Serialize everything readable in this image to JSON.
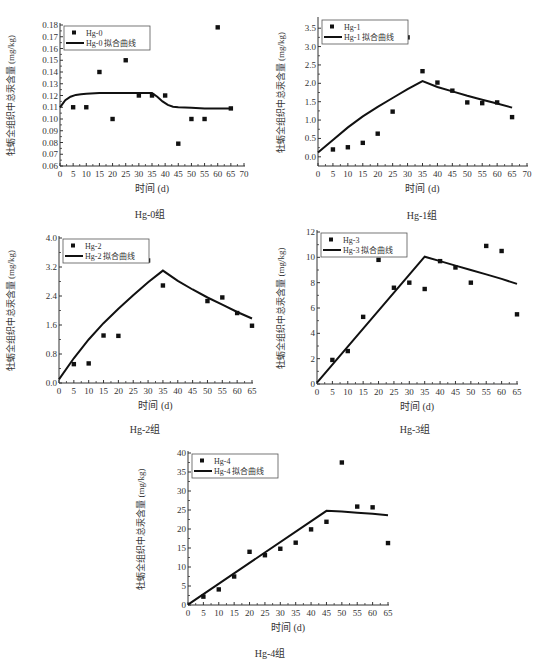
{
  "common": {
    "ylabel": "牡蛎全组织中总汞含量 (mg/kg)",
    "xlabel": "时间 (d)"
  },
  "chart_data": [
    {
      "id": "hg0",
      "type": "scatter",
      "caption": "Hg-0组",
      "title": "",
      "xlabel": "时间 (d)",
      "ylabel": "牡蛎全组织中总汞含量 (mg/kg)",
      "xlim": [
        0,
        70
      ],
      "ylim": [
        0.06,
        0.18
      ],
      "xticks": [
        0,
        5,
        10,
        15,
        20,
        25,
        30,
        35,
        40,
        45,
        50,
        55,
        60,
        65,
        70
      ],
      "yticks": [
        0.06,
        0.07,
        0.08,
        0.09,
        0.1,
        0.11,
        0.12,
        0.13,
        0.14,
        0.15,
        0.16,
        0.17,
        0.18
      ],
      "ytick_labels": [
        "0.06",
        "0.07",
        "0.08",
        "0.09",
        "0.10",
        "0.11",
        "0.12",
        "0.13",
        "0.14",
        "0.15",
        "0.16",
        "0.17",
        "0.18"
      ],
      "legend": [
        "Hg-0",
        "Hg-0 拟合曲线"
      ],
      "legend_position": "upper left",
      "series": [
        {
          "name": "Hg-0",
          "kind": "points",
          "x": [
            5,
            10,
            15,
            20,
            25,
            30,
            35,
            40,
            45,
            50,
            55,
            60,
            65
          ],
          "y": [
            0.11,
            0.11,
            0.14,
            0.1,
            0.15,
            0.12,
            0.12,
            0.12,
            0.079,
            0.1,
            0.1,
            0.178,
            0.109
          ]
        },
        {
          "name": "Hg-0 拟合曲线",
          "kind": "line",
          "x": [
            0,
            2,
            4,
            6,
            8,
            10,
            15,
            20,
            25,
            30,
            35,
            37,
            39,
            41,
            43,
            45,
            50,
            55,
            60,
            65
          ],
          "y": [
            0.11,
            0.116,
            0.119,
            0.1205,
            0.121,
            0.1215,
            0.122,
            0.122,
            0.122,
            0.122,
            0.122,
            0.119,
            0.115,
            0.112,
            0.1105,
            0.11,
            0.1095,
            0.109,
            0.109,
            0.109
          ]
        }
      ]
    },
    {
      "id": "hg1",
      "type": "scatter",
      "caption": "Hg-1组",
      "title": "",
      "xlabel": "时间 (d)",
      "ylabel": "牡蛎全组织中总汞含量 (mg/kg)",
      "xlim": [
        0,
        70
      ],
      "ylim": [
        -0.25,
        3.75
      ],
      "xticks": [
        0,
        5,
        10,
        15,
        20,
        25,
        30,
        35,
        40,
        45,
        50,
        55,
        60,
        65,
        70
      ],
      "yticks": [
        0.0,
        0.5,
        1.0,
        1.5,
        2.0,
        2.5,
        3.0,
        3.5
      ],
      "ytick_labels": [
        "0.0",
        "0.5",
        "1.0",
        "1.5",
        "2.0",
        "2.5",
        "3.0",
        "3.5"
      ],
      "legend": [
        "Hg-1",
        "Hg-1 拟合曲线"
      ],
      "legend_position": "upper left",
      "series": [
        {
          "name": "Hg-1",
          "kind": "points",
          "x": [
            5,
            10,
            15,
            20,
            25,
            30,
            35,
            40,
            45,
            50,
            55,
            60,
            65
          ],
          "y": [
            0.2,
            0.26,
            0.38,
            0.63,
            1.23,
            3.25,
            2.33,
            2.02,
            1.8,
            1.48,
            1.46,
            1.48,
            1.08
          ]
        },
        {
          "name": "Hg-1 拟合曲线",
          "kind": "line",
          "x": [
            0,
            5,
            10,
            15,
            20,
            25,
            30,
            35,
            40,
            45,
            50,
            55,
            60,
            65
          ],
          "y": [
            0.12,
            0.46,
            0.8,
            1.1,
            1.36,
            1.6,
            1.84,
            2.06,
            1.9,
            1.78,
            1.66,
            1.55,
            1.45,
            1.34
          ]
        }
      ]
    },
    {
      "id": "hg2",
      "type": "scatter",
      "caption": "Hg-2组",
      "title": "",
      "xlabel": "时间 (d)",
      "ylabel": "牡蛎全组织中总汞含量 (mg/kg)",
      "xlim": [
        0,
        65
      ],
      "ylim": [
        0.0,
        4.0
      ],
      "xticks": [
        0,
        5,
        10,
        15,
        20,
        25,
        30,
        35,
        40,
        45,
        50,
        55,
        60,
        65
      ],
      "yticks": [
        0.0,
        0.8,
        1.6,
        2.4,
        3.2,
        4.0
      ],
      "ytick_labels": [
        "0.0",
        "0.8",
        "1.6",
        "2.4",
        "3.2",
        "4.0"
      ],
      "legend": [
        "Hg-2",
        "Hg-2 拟合曲线"
      ],
      "legend_position": "upper left",
      "series": [
        {
          "name": "Hg-2",
          "kind": "points",
          "x": [
            5,
            10,
            15,
            20,
            25,
            30,
            35,
            50,
            55,
            60,
            65
          ],
          "y": [
            0.52,
            0.54,
            1.31,
            1.3,
            3.66,
            3.38,
            2.69,
            2.26,
            2.36,
            1.93,
            1.58
          ]
        },
        {
          "name": "Hg-2 拟合曲线",
          "kind": "line",
          "x": [
            0,
            5,
            10,
            15,
            20,
            25,
            30,
            35,
            40,
            45,
            50,
            55,
            60,
            65
          ],
          "y": [
            0.1,
            0.68,
            1.2,
            1.65,
            2.05,
            2.42,
            2.78,
            3.1,
            2.82,
            2.58,
            2.36,
            2.16,
            1.96,
            1.78
          ]
        }
      ]
    },
    {
      "id": "hg3",
      "type": "scatter",
      "caption": "Hg-3组",
      "title": "",
      "xlabel": "时间 (d)",
      "ylabel": "牡蛎全组织中总汞含量 (mg/kg)",
      "xlim": [
        0,
        65
      ],
      "ylim": [
        0,
        12
      ],
      "xticks": [
        0,
        5,
        10,
        15,
        20,
        25,
        30,
        35,
        40,
        45,
        50,
        55,
        60,
        65
      ],
      "yticks": [
        0,
        2,
        4,
        6,
        8,
        10,
        12
      ],
      "ytick_labels": [
        "0",
        "2",
        "4",
        "6",
        "8",
        "10",
        "12"
      ],
      "legend": [
        "Hg-3",
        "Hg-3 拟合曲线"
      ],
      "legend_position": "upper left",
      "series": [
        {
          "name": "Hg-3",
          "kind": "points",
          "x": [
            5,
            10,
            15,
            20,
            25,
            30,
            35,
            40,
            45,
            50,
            55,
            60,
            65
          ],
          "y": [
            1.9,
            2.6,
            5.3,
            9.8,
            7.6,
            8.0,
            7.5,
            9.7,
            9.2,
            8.0,
            10.9,
            10.5,
            5.5
          ]
        },
        {
          "name": "Hg-3 拟合曲线",
          "kind": "line",
          "x": [
            0,
            35,
            40,
            45,
            50,
            55,
            60,
            65
          ],
          "y": [
            0.1,
            10.05,
            9.7,
            9.35,
            9.0,
            8.65,
            8.3,
            7.9
          ]
        }
      ]
    },
    {
      "id": "hg4",
      "type": "scatter",
      "caption": "Hg-4组",
      "title": "",
      "xlabel": "时间 (d)",
      "ylabel": "牡蛎全组织中总汞含量 (mg/kg)",
      "xlim": [
        0,
        65
      ],
      "ylim": [
        0,
        40
      ],
      "xticks": [
        0,
        5,
        10,
        15,
        20,
        25,
        30,
        35,
        40,
        45,
        50,
        55,
        60,
        65
      ],
      "yticks": [
        0,
        5,
        10,
        15,
        20,
        25,
        30,
        35,
        40
      ],
      "ytick_labels": [
        "0",
        "5",
        "10",
        "15",
        "20",
        "25",
        "30",
        "35",
        "40"
      ],
      "legend": [
        "Hg-4",
        "Hg-4 拟合曲线"
      ],
      "legend_position": "upper left",
      "series": [
        {
          "name": "Hg-4",
          "kind": "points",
          "x": [
            5,
            10,
            15,
            20,
            25,
            30,
            35,
            40,
            45,
            50,
            55,
            60,
            65
          ],
          "y": [
            2.2,
            4.1,
            7.5,
            14.0,
            13.1,
            14.8,
            16.4,
            19.9,
            21.9,
            37.5,
            25.9,
            25.7,
            16.3
          ]
        },
        {
          "name": "Hg-4 拟合曲线",
          "kind": "line",
          "x": [
            0,
            45,
            50,
            55,
            60,
            65
          ],
          "y": [
            0.1,
            24.8,
            24.6,
            24.3,
            24.0,
            23.6
          ]
        }
      ]
    }
  ]
}
